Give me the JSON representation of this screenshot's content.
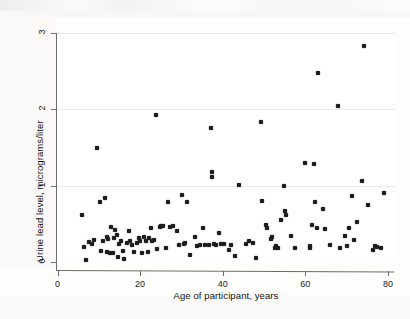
{
  "figure": {
    "background_color": "#ffffff",
    "point_color": "#1d1d1d",
    "axis_color": "#6d6d68",
    "grid_color": "#e9e9e6"
  },
  "chart_data": {
    "type": "scatter",
    "title": "",
    "xlabel": "Age of participant, years",
    "ylabel": "Urine lead level, micrograms/liter",
    "xlim": [
      0,
      82
    ],
    "ylim": [
      0,
      3
    ],
    "xticks": [
      0,
      20,
      40,
      60,
      80
    ],
    "xtick_labels": [
      "0",
      "20",
      "40",
      "60",
      "80"
    ],
    "yticks": [
      0,
      1,
      2,
      3
    ],
    "ytick_labels": [
      "0",
      "1",
      "2",
      "3"
    ],
    "grid": "horizontal",
    "legend": "none",
    "marker": "filled-diamond",
    "n_points": 121,
    "points": [
      [
        6.0,
        0.62
      ],
      [
        6.3,
        0.2
      ],
      [
        7.0,
        0.03
      ],
      [
        7.6,
        0.26
      ],
      [
        8.4,
        0.24
      ],
      [
        8.8,
        0.29
      ],
      [
        9.6,
        1.5
      ],
      [
        10.2,
        0.78
      ],
      [
        10.6,
        0.15
      ],
      [
        11.0,
        0.28
      ],
      [
        11.6,
        0.84
      ],
      [
        11.9,
        0.13
      ],
      [
        12.3,
        0.3
      ],
      [
        12.6,
        0.12
      ],
      [
        13.0,
        0.46
      ],
      [
        13.4,
        0.12
      ],
      [
        13.7,
        0.31
      ],
      [
        14.0,
        0.42
      ],
      [
        14.3,
        0.36
      ],
      [
        14.6,
        0.07
      ],
      [
        15.0,
        0.24
      ],
      [
        15.4,
        0.27
      ],
      [
        15.8,
        0.14
      ],
      [
        16.2,
        0.04
      ],
      [
        16.8,
        0.25
      ],
      [
        17.2,
        0.41
      ],
      [
        17.6,
        0.27
      ],
      [
        18.0,
        0.22
      ],
      [
        18.5,
        0.13
      ],
      [
        19.2,
        0.25
      ],
      [
        19.8,
        0.31
      ],
      [
        20.4,
        0.12
      ],
      [
        21.0,
        0.33
      ],
      [
        21.4,
        0.28
      ],
      [
        21.8,
        0.13
      ],
      [
        22.2,
        0.31
      ],
      [
        22.6,
        0.45
      ],
      [
        22.9,
        0.27
      ],
      [
        23.3,
        0.29
      ],
      [
        23.8,
        1.93
      ],
      [
        24.2,
        0.17
      ],
      [
        25.0,
        0.47
      ],
      [
        25.6,
        0.47
      ],
      [
        26.2,
        0.18
      ],
      [
        26.8,
        0.78
      ],
      [
        27.2,
        0.46
      ],
      [
        28.0,
        0.47
      ],
      [
        29.0,
        0.41
      ],
      [
        30.2,
        0.88
      ],
      [
        30.6,
        0.23
      ],
      [
        30.9,
        0.25
      ],
      [
        31.4,
        0.78
      ],
      [
        32.0,
        0.09
      ],
      [
        33.2,
        0.33
      ],
      [
        34.6,
        0.22
      ],
      [
        35.2,
        0.45
      ],
      [
        35.8,
        0.22
      ],
      [
        36.6,
        0.22
      ],
      [
        37.2,
        1.75
      ],
      [
        37.4,
        1.18
      ],
      [
        37.5,
        1.12
      ],
      [
        37.8,
        0.24
      ],
      [
        38.4,
        0.22
      ],
      [
        39.0,
        0.38
      ],
      [
        39.6,
        0.24
      ],
      [
        40.2,
        0.23
      ],
      [
        41.4,
        0.16
      ],
      [
        43.0,
        0.08
      ],
      [
        44.0,
        1.01
      ],
      [
        45.6,
        0.24
      ],
      [
        46.4,
        0.27
      ],
      [
        48.0,
        0.05
      ],
      [
        49.2,
        1.84
      ],
      [
        49.6,
        0.8
      ],
      [
        50.4,
        0.48
      ],
      [
        50.8,
        0.44
      ],
      [
        51.6,
        0.3
      ],
      [
        52.0,
        0.33
      ],
      [
        52.6,
        0.19
      ],
      [
        53.0,
        0.21
      ],
      [
        53.4,
        0.18
      ],
      [
        54.2,
        0.55
      ],
      [
        54.8,
        0.99
      ],
      [
        55.0,
        0.67
      ],
      [
        55.2,
        0.61
      ],
      [
        56.6,
        0.34
      ],
      [
        59.8,
        1.3
      ],
      [
        61.0,
        0.21
      ],
      [
        61.2,
        0.19
      ],
      [
        61.6,
        0.49
      ],
      [
        62.0,
        1.28
      ],
      [
        62.4,
        0.78
      ],
      [
        62.8,
        0.44
      ],
      [
        63.0,
        2.47
      ],
      [
        64.2,
        0.69
      ],
      [
        68.0,
        2.04
      ],
      [
        68.4,
        0.18
      ],
      [
        69.6,
        0.34
      ],
      [
        70.6,
        0.44
      ],
      [
        71.4,
        0.87
      ],
      [
        71.8,
        0.29
      ],
      [
        72.4,
        0.52
      ],
      [
        73.6,
        1.06
      ],
      [
        74.2,
        2.83
      ],
      [
        75.2,
        0.75
      ],
      [
        76.4,
        0.16
      ],
      [
        76.8,
        0.21
      ],
      [
        78.2,
        0.18
      ],
      [
        79.0,
        0.9
      ],
      [
        12.0,
        0.33
      ],
      [
        20.0,
        0.28
      ],
      [
        24.8,
        0.46
      ],
      [
        29.4,
        0.22
      ],
      [
        33.8,
        0.21
      ],
      [
        42.0,
        0.22
      ],
      [
        47.2,
        0.25
      ],
      [
        57.4,
        0.19
      ],
      [
        64.8,
        0.43
      ],
      [
        66.0,
        0.22
      ],
      [
        70.0,
        0.21
      ],
      [
        77.4,
        0.2
      ]
    ]
  }
}
